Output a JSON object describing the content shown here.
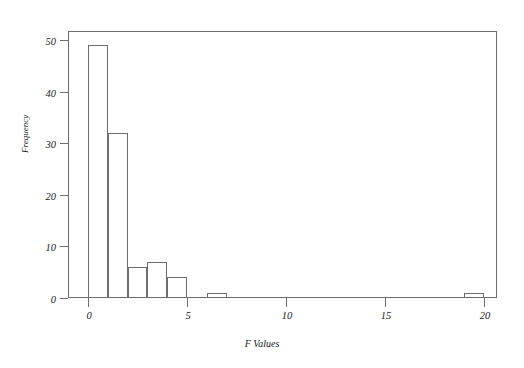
{
  "chart_data": {
    "type": "bar",
    "title": "",
    "subtitle": "",
    "xlabel": "F Values",
    "ylabel": "Frequency",
    "xlim": [
      0,
      20.2
    ],
    "ylim": [
      0,
      51
    ],
    "grid": false,
    "legend": null,
    "bin_width": 1,
    "xticks": [
      0,
      5,
      10,
      15,
      20
    ],
    "xtick_labels": [
      "0",
      "5",
      "10",
      "15",
      "20"
    ],
    "yticks": [
      0,
      10,
      20,
      30,
      40,
      50
    ],
    "ytick_labels": [
      "0",
      "10",
      "20",
      "30",
      "40",
      "50"
    ],
    "bins": [
      {
        "x0": 0,
        "x1": 1,
        "value": 49
      },
      {
        "x0": 1,
        "x1": 2,
        "value": 32
      },
      {
        "x0": 2,
        "x1": 3,
        "value": 6
      },
      {
        "x0": 3,
        "x1": 4,
        "value": 7
      },
      {
        "x0": 4,
        "x1": 5,
        "value": 4
      },
      {
        "x0": 6,
        "x1": 7,
        "value": 1
      },
      {
        "x0": 19,
        "x1": 20,
        "value": 1
      }
    ],
    "categories": [
      "0-1",
      "1-2",
      "2-3",
      "3-4",
      "4-5",
      "6-7",
      "19-20"
    ],
    "values": [
      49,
      32,
      6,
      7,
      4,
      1,
      1
    ],
    "colors": {
      "background": "#ffffff",
      "axis": "#6e6e6e",
      "bar_stroke": "#6e6e6e",
      "bar_fill": "transparent",
      "text": "#1a1a1a"
    }
  }
}
